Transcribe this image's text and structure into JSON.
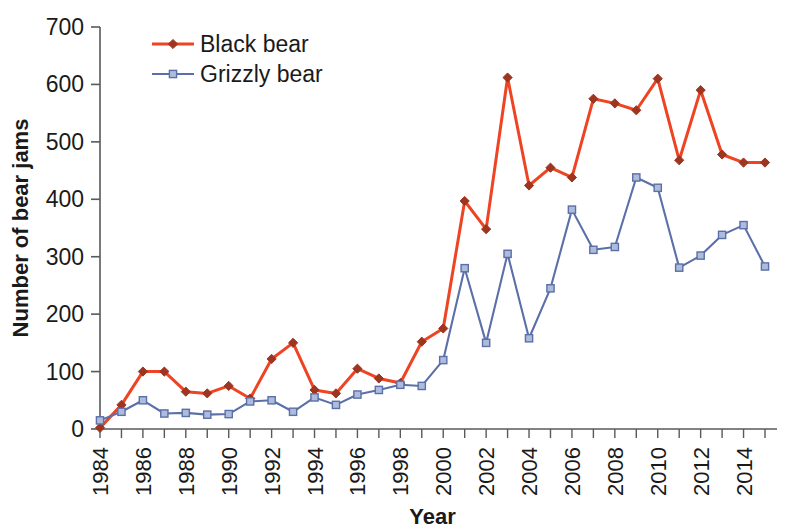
{
  "chart_data": {
    "type": "line",
    "title": "",
    "xlabel": "Year",
    "ylabel": "Number of bear jams",
    "xlim": [
      1984,
      2015
    ],
    "ylim": [
      0,
      700
    ],
    "ytick_step": 100,
    "yticks": [
      0,
      100,
      200,
      300,
      400,
      500,
      600,
      700
    ],
    "xticks": [
      1984,
      1986,
      1988,
      1990,
      1992,
      1994,
      1996,
      1998,
      2000,
      2002,
      2004,
      2006,
      2008,
      2010,
      2012,
      2014
    ],
    "xtick_labels": [
      "1984",
      "1986",
      "1988",
      "1990",
      "1992",
      "1994",
      "1996",
      "1998",
      "2000",
      "2002",
      "2004",
      "2006",
      "2008",
      "2010",
      "2012",
      "2014"
    ],
    "x": [
      1984,
      1985,
      1986,
      1987,
      1988,
      1989,
      1990,
      1991,
      1992,
      1993,
      1994,
      1995,
      1996,
      1997,
      1998,
      1999,
      2000,
      2001,
      2002,
      2003,
      2004,
      2005,
      2006,
      2007,
      2008,
      2009,
      2010,
      2011,
      2012,
      2013,
      2014,
      2015
    ],
    "grid": false,
    "legend_position": "top-left",
    "series": [
      {
        "name": "Black bear",
        "color": "#EE4423",
        "marker": "diamond",
        "marker_color": "#9E3520",
        "values": [
          2,
          42,
          100,
          100,
          65,
          62,
          75,
          53,
          122,
          150,
          68,
          62,
          105,
          88,
          80,
          152,
          175,
          397,
          348,
          612,
          424,
          455,
          438,
          575,
          567,
          555,
          610,
          468,
          590,
          478,
          464,
          464
        ]
      },
      {
        "name": "Grizzly bear",
        "color": "#5B6FA8",
        "marker": "square",
        "marker_color": "#AEBCDC",
        "values": [
          15,
          30,
          50,
          27,
          28,
          25,
          26,
          48,
          50,
          30,
          55,
          42,
          60,
          68,
          77,
          75,
          120,
          280,
          150,
          305,
          158,
          245,
          382,
          312,
          317,
          438,
          420,
          281,
          302,
          338,
          355,
          283
        ]
      }
    ],
    "legend": [
      {
        "label": "Black bear",
        "color": "#EE4423",
        "marker_color": "#9E3520",
        "marker": "diamond"
      },
      {
        "label": "Grizzly bear",
        "color": "#5B6FA8",
        "marker_color": "#AEBCDC",
        "marker": "square"
      }
    ]
  }
}
